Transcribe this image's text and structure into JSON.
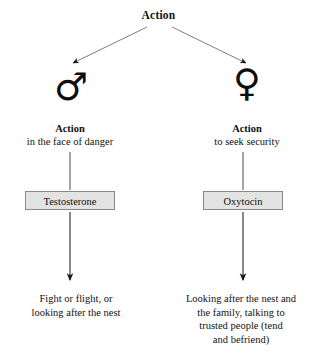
{
  "diagram": {
    "title": "Action",
    "branches": [
      {
        "id": "male",
        "symbol": "♂",
        "symbol_name": "male-symbol",
        "action_header": "Action",
        "action_sub": "in the face of danger",
        "hormone": "Testosterone",
        "outcome_lines": [
          "Fight or flight, or",
          "looking after the nest"
        ]
      },
      {
        "id": "female",
        "symbol": "♀",
        "symbol_name": "female-symbol",
        "action_header": "Action",
        "action_sub": "to seek security",
        "hormone": "Oxytocin",
        "outcome_lines": [
          "Looking after the nest and",
          "the family, talking to",
          "trusted people (tend",
          "and befriend)"
        ]
      }
    ],
    "colors": {
      "background": "#ffffff",
      "text": "#111111",
      "box_fill": "#e3e3e3",
      "box_border": "#8a8a8a",
      "arrow": "#2b2b2b",
      "diagonal_arrow": "#6e6e6e"
    }
  }
}
